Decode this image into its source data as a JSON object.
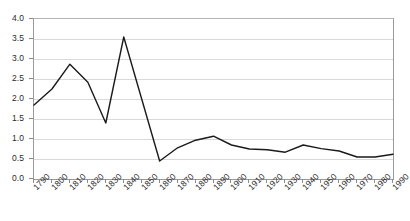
{
  "chart_data": {
    "type": "line",
    "title": "",
    "subtitle": "",
    "xlabel": "",
    "ylabel": "",
    "grid": true,
    "legend": false,
    "legend_position": "none",
    "line_color": "#1a1a1a",
    "gridline_color": "#d9d9d9",
    "axis_color": "#9a9a9a",
    "xlim": [
      1790,
      1990
    ],
    "ylim": [
      0.0,
      4.0
    ],
    "y_tick_step": 0.5,
    "x_tick_step": 10,
    "x": [
      1790,
      1800,
      1810,
      1820,
      1830,
      1840,
      1850,
      1860,
      1870,
      1880,
      1890,
      1900,
      1910,
      1920,
      1930,
      1940,
      1950,
      1960,
      1970,
      1980,
      1990
    ],
    "categories": [
      "1790",
      "1800",
      "1810",
      "1820",
      "1830",
      "1840",
      "1850",
      "1860",
      "1870",
      "1880",
      "1890",
      "1900",
      "1910",
      "1920",
      "1930",
      "1940",
      "1950",
      "1960",
      "1970",
      "1980",
      "1990"
    ],
    "values": [
      1.85,
      2.25,
      2.87,
      2.42,
      1.4,
      3.55,
      2.0,
      0.45,
      0.78,
      0.97,
      1.07,
      0.85,
      0.75,
      0.73,
      0.67,
      0.85,
      0.76,
      0.7,
      0.55,
      0.55,
      0.62
    ],
    "series": [
      {
        "name": "series-1",
        "values": [
          1.85,
          2.25,
          2.87,
          2.42,
          1.4,
          3.55,
          2.0,
          0.45,
          0.78,
          0.97,
          1.07,
          0.85,
          0.75,
          0.73,
          0.67,
          0.85,
          0.76,
          0.7,
          0.55,
          0.55,
          0.62
        ]
      }
    ],
    "y_tick_labels": [
      "0.0",
      "0.5",
      "1.0",
      "1.5",
      "2.0",
      "2.5",
      "3.0",
      "3.5",
      "4.0"
    ],
    "y_tick_values": [
      0.0,
      0.5,
      1.0,
      1.5,
      2.0,
      2.5,
      3.0,
      3.5,
      4.0
    ]
  }
}
